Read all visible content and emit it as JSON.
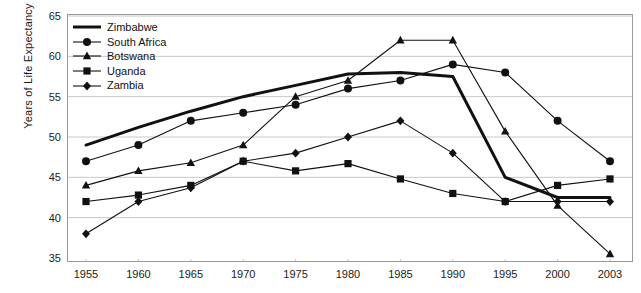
{
  "chart_data": {
    "type": "line",
    "title": "",
    "xlabel": "",
    "ylabel": "Years of Life Expectancy",
    "x": [
      1955,
      1960,
      1965,
      1970,
      1975,
      1980,
      1985,
      1990,
      1995,
      2000,
      2003
    ],
    "xticklabels": [
      "1955",
      "1960",
      "1965",
      "1970",
      "1975",
      "1980",
      "1985",
      "1990",
      "1995",
      "2000",
      "2003"
    ],
    "yticklabels": [
      "35",
      "40",
      "45",
      "50",
      "55",
      "60",
      "65"
    ],
    "yticks": [
      35,
      40,
      45,
      50,
      55,
      60,
      65
    ],
    "ylim": [
      35,
      65
    ],
    "grid": "horizontal",
    "legend_position": "upper-left-inside",
    "series": [
      {
        "name": "Zimbabwe",
        "marker": "none",
        "values": [
          49,
          51.2,
          53.2,
          55,
          56.4,
          57.8,
          58,
          57.5,
          45,
          42.5,
          42.5
        ]
      },
      {
        "name": "South Africa",
        "marker": "circle",
        "values": [
          47,
          49,
          52,
          53,
          54,
          56,
          57,
          59,
          58,
          52,
          47
        ]
      },
      {
        "name": "Botswana",
        "marker": "triangle",
        "values": [
          44,
          45.8,
          46.8,
          49,
          55,
          57,
          62,
          62,
          50.7,
          41.5,
          35.5
        ]
      },
      {
        "name": "Uganda",
        "marker": "square",
        "values": [
          42,
          42.8,
          44,
          47,
          45.8,
          46.7,
          44.8,
          43,
          42,
          44,
          44.8
        ]
      },
      {
        "name": "Zambia",
        "marker": "diamond",
        "values": [
          38,
          42,
          43.7,
          47,
          48,
          50,
          52,
          48,
          42,
          42,
          42
        ]
      }
    ]
  },
  "legend": {
    "items": [
      {
        "label": "Zimbabwe"
      },
      {
        "label": "South Africa"
      },
      {
        "label": "Botswana"
      },
      {
        "label": "Uganda"
      },
      {
        "label": "Zambia"
      }
    ]
  },
  "colors": {
    "line": "#111111",
    "grid": "#c8c8c8",
    "frame": "#9a9a9a",
    "text": "#1a1a1a"
  }
}
